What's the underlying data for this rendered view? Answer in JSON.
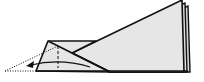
{
  "diagram": {
    "type": "origami-fold-step",
    "colors": {
      "paper": "#e6e6e6",
      "paper_back": "#d8d8d8",
      "line": "#111111",
      "background": "#ffffff"
    },
    "elements": [
      {
        "name": "folded-sheet-layers",
        "kind": "paper"
      },
      {
        "name": "left-flap",
        "kind": "paper"
      },
      {
        "name": "valley-fold-line",
        "kind": "dashed-line"
      },
      {
        "name": "projected-fold-outline",
        "kind": "dotted-line"
      },
      {
        "name": "fold-direction-arrow",
        "kind": "arrow",
        "direction": "left"
      }
    ]
  }
}
